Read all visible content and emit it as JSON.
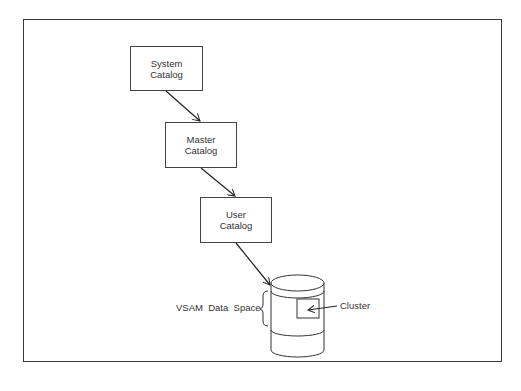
{
  "diagram": {
    "nodes": [
      {
        "id": "system",
        "line1": "System",
        "line2": "Catalog"
      },
      {
        "id": "master",
        "line1": "Master",
        "line2": "Catalog"
      },
      {
        "id": "user",
        "line1": "User",
        "line2": "Catalog"
      }
    ],
    "data_space_label": "VSAM  Data  Space",
    "cluster_label": "Cluster",
    "edges": [
      {
        "from": "System Catalog",
        "to": "Master Catalog"
      },
      {
        "from": "Master Catalog",
        "to": "User Catalog"
      },
      {
        "from": "User Catalog",
        "to": "VSAM Data Space"
      },
      {
        "from": "Cluster label",
        "to": "Cluster"
      }
    ]
  }
}
